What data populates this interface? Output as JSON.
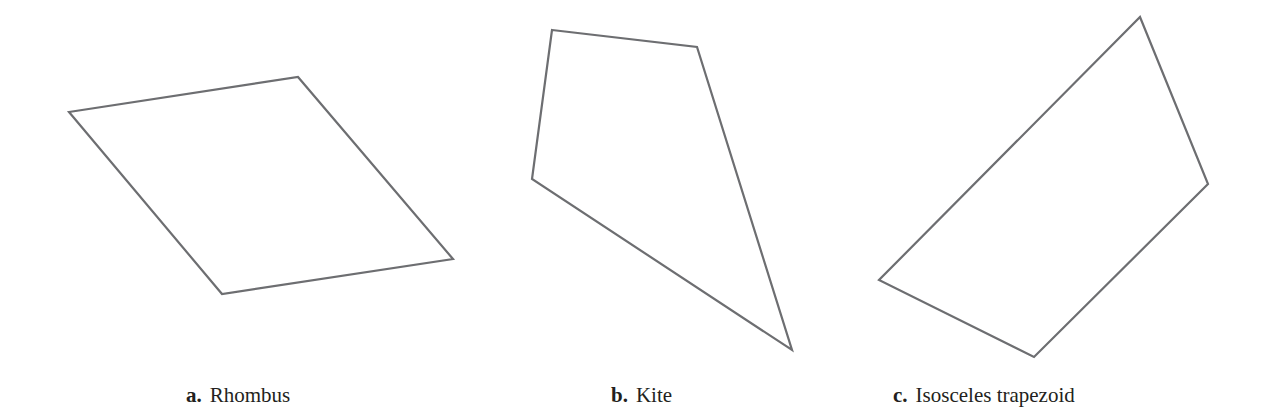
{
  "figure": {
    "stroke_color": "#6d6e71",
    "stroke_width": 2.2,
    "shapes": [
      {
        "id": "a",
        "letter": "a.",
        "label": "Rhombus",
        "points": "69,112 298,77 453,259 222,294"
      },
      {
        "id": "b",
        "letter": "b.",
        "label": "Kite",
        "points": "552,30 697,47 792,350 532,179"
      },
      {
        "id": "c",
        "letter": "c.",
        "label": "Isosceles trapezoid",
        "points": "1140,17 1208,184 1034,357 879,280"
      }
    ]
  }
}
